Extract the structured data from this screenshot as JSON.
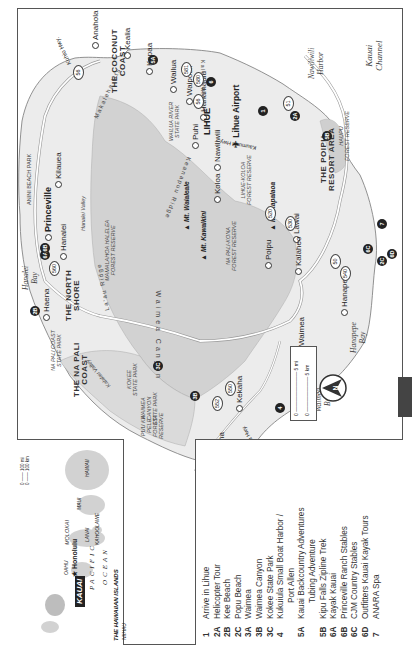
{
  "map": {
    "title": "Kauai",
    "region_labels": [
      {
        "id": "north-shore",
        "text": "THE NORTH\nSHORE"
      },
      {
        "id": "coconut-coast",
        "text": "THE COCONUT\nCOAST"
      },
      {
        "id": "na-pali-coast",
        "text": "THE NA PALI\nCOAST"
      },
      {
        "id": "poipu-resort",
        "text": "THE POIPU\nRESORT AREA"
      }
    ],
    "towns": {
      "anahola": "Anahola",
      "kealia": "Kealia",
      "kapaa": "Kapaa",
      "wailua": "Wailua",
      "waipouli": "Waipouli",
      "hanamaulu": "Hanamaulu",
      "lihue_airport": "Lihue Airport",
      "lihue": "LIHUE",
      "puhi": "Puhi",
      "nawiliwili": "Nawiliwili",
      "koloa": "Koloa",
      "poipu": "Poipu",
      "lawai": "Lawai",
      "kalaheo": "Kalaheo",
      "hanapepe": "Hanapepe",
      "waimea": "Waimea",
      "kekaha": "Kekaha",
      "mana": "Mana",
      "haena": "Haena",
      "hanalei": "Hanalei",
      "princeville": "Princeville",
      "kilauea": "Kilauea"
    },
    "parks_and_reserves": {
      "anini": "ANINI BEACH PARK",
      "wailua_river": "WAILUA RIVER\nSTATE PARK",
      "mamalahoa": "MAMALAHOA HALELEA\nFOREST RESERVE",
      "lihue_koloa": "LIHUE-KOLOA\nFOREST RESERVE",
      "na_pali_kona": "NA PALI-KONA\nFOREST RESERVE",
      "haupu": "HAUPU\nFOREST RESERVE",
      "na_pali_coast_sp": "NA PALI COAST\nSTATE PARK",
      "kokee": "KOKEE\nSTATE PARK",
      "waimea_canyon_sp": "WAIMEA\nCANYON\nSTATE PARK",
      "puu_ka_pele": "PUU KA\nPELE\nFOREST\nRESERVE"
    },
    "terrain": {
      "makaleha": "Makaleha Mts.",
      "keanapuu": "Keanapuu Ridge",
      "lau_ridge": "La'au Ridge",
      "hanalei_valley": "Hanalei Valley",
      "kalalau_valley": "Kalalau Valley",
      "waimea_canyon": "Waimea Canyon",
      "kalepa_ridge": "Kalepa Ridge",
      "mt_waialeale": "Mt. Waialeale",
      "mt_kawaikini": "Mt. Kawaikini",
      "mt_kapalaoa": "Mt. Kapalaoa"
    },
    "roads": {
      "kuhio": "Kuhio Hwy.",
      "kaumualii": "Kaumualii Hwy.",
      "kaumualii_west": "Kaumualii Hwy.",
      "shields": [
        "56",
        "56",
        "581",
        "580",
        "51",
        "520",
        "530",
        "540",
        "50",
        "550",
        "552",
        "560",
        "50"
      ]
    },
    "water": {
      "hanalei_bay": "Hanalei\nBay",
      "nawiliwili_harbor": "Nawiliwili\nHarbor",
      "kauai_channel": "Kauai\nChannel",
      "hanapepe_bay": "Hanapepe\nBay",
      "waimea_bay": "Waimea\nBay",
      "pacific": "PACIFIC",
      "ocean": "OCEAN"
    },
    "markers": [
      "1",
      "2A",
      "2B",
      "2C",
      "3A",
      "3B",
      "3C",
      "4",
      "5A",
      "5B",
      "6",
      "6A",
      "6B",
      "6C",
      "6D",
      "7"
    ],
    "scale": {
      "mi": "5 mi",
      "km": "5 km",
      "zero": "0"
    }
  },
  "inset": {
    "title": "THE HAWAIIAN ISLANDS",
    "islands": {
      "niihau": "NIIHAU",
      "kauai": "KAUAI",
      "oahu": "OAHU",
      "honolulu": "Honolulu",
      "molokai": "MOLOKAI",
      "lanai": "LANAI",
      "kahoolawe": "KAHOOLAWE",
      "maui": "MAUI",
      "hawaii": "HAWAII"
    },
    "ocean1": "PACIFIC",
    "ocean2": "OCEAN",
    "scale": {
      "mi": "100 mi",
      "km": "100 km",
      "zero": "0"
    }
  },
  "legend": {
    "items": [
      {
        "num": "1",
        "text": "Arrive in Lihue"
      },
      {
        "num": "2A",
        "text": "Helicopter Tour"
      },
      {
        "num": "2B",
        "text": "Kee Beach"
      },
      {
        "num": "2C",
        "text": "Popu Beach"
      },
      {
        "num": "3A",
        "text": "Waimea"
      },
      {
        "num": "3B",
        "text": "Waimea Canyon"
      },
      {
        "num": "3C",
        "text": "Kokee State Park"
      },
      {
        "num": "4",
        "text": "Kukuiula Small Boat Harbor /"
      },
      {
        "num": "",
        "text": "Port Allen"
      },
      {
        "num": "5A",
        "text": "Kauai Backcountry Adventures"
      },
      {
        "num": "",
        "text": "Tubing Adventure"
      },
      {
        "num": "5B",
        "text": "Kipu Falls Zipline Trek"
      },
      {
        "num": "6A",
        "text": "Kayak Kauai"
      },
      {
        "num": "6B",
        "text": "Princeville Ranch Stables"
      },
      {
        "num": "6C",
        "text": "CJM Country Stables"
      },
      {
        "num": "6D",
        "text": "Outfitters Kauai Kayak Tours"
      },
      {
        "num": "7",
        "text": "ANARA Spa"
      }
    ]
  },
  "colors": {
    "land": "#ececec",
    "highland": "#d4d4d4",
    "reserve": "#c8c8c8",
    "road": "#ffffff",
    "marker": "#222222",
    "border": "#555555"
  }
}
